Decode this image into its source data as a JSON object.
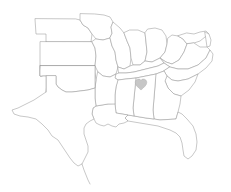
{
  "map": {
    "title": "United States outline map — Central and Southeastern region",
    "type": "vector-outline-map",
    "background_color": "#ffffff",
    "outline_color": "#9a9a9a",
    "outline_width_px": 0.55,
    "width_px": 231,
    "height_px": 192,
    "projection_note": "unlabeled outline map, no graticule, no legend, no text labels",
    "states": [
      {
        "id": "nebraska",
        "name": "Nebraska",
        "label_visible": false
      },
      {
        "id": "iowa",
        "name": "Iowa",
        "label_visible": false
      },
      {
        "id": "kansas",
        "name": "Kansas",
        "label_visible": false
      },
      {
        "id": "missouri",
        "name": "Missouri",
        "label_visible": false
      },
      {
        "id": "illinois",
        "name": "Illinois",
        "label_visible": false
      },
      {
        "id": "indiana",
        "name": "Indiana",
        "label_visible": false
      },
      {
        "id": "ohio",
        "name": "Ohio",
        "label_visible": false
      },
      {
        "id": "west-virginia",
        "name": "West Virginia",
        "label_visible": false
      },
      {
        "id": "maryland",
        "name": "Maryland",
        "label_visible": false
      },
      {
        "id": "delaware",
        "name": "Delaware",
        "label_visible": false
      },
      {
        "id": "virginia",
        "name": "Virginia",
        "label_visible": false
      },
      {
        "id": "kentucky",
        "name": "Kentucky",
        "label_visible": false
      },
      {
        "id": "tennessee",
        "name": "Tennessee",
        "label_visible": false
      },
      {
        "id": "north-carolina",
        "name": "North Carolina",
        "label_visible": false
      },
      {
        "id": "south-carolina",
        "name": "South Carolina",
        "label_visible": false
      },
      {
        "id": "georgia",
        "name": "Georgia",
        "label_visible": false
      },
      {
        "id": "florida",
        "name": "Florida",
        "label_visible": false
      },
      {
        "id": "alabama",
        "name": "Alabama",
        "label_visible": false
      },
      {
        "id": "mississippi",
        "name": "Mississippi",
        "label_visible": false
      },
      {
        "id": "louisiana",
        "name": "Louisiana",
        "label_visible": false
      },
      {
        "id": "arkansas",
        "name": "Arkansas",
        "label_visible": false
      },
      {
        "id": "oklahoma",
        "name": "Oklahoma",
        "label_visible": false
      },
      {
        "id": "texas",
        "name": "Texas",
        "label_visible": false
      }
    ],
    "markers": [
      {
        "id": "alabama-heart",
        "shape": "heart",
        "color": "#c6c6c6",
        "stroke_color": "#a8a8a8",
        "located_in_state": "Alabama",
        "center_x_px": 141,
        "center_y_px": 85,
        "width_px": 11,
        "height_px": 10,
        "label_visible": false
      }
    ]
  }
}
